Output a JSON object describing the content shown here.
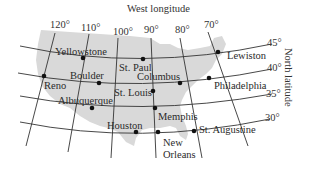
{
  "map": {
    "title": "West longitude",
    "side_label": "North latitude",
    "land_color": "#d9d9d9",
    "line_color": "#333333",
    "dot_color": "#111111",
    "longitudes": [
      {
        "label": "120°",
        "value": 120
      },
      {
        "label": "110°",
        "value": 110
      },
      {
        "label": "100°",
        "value": 100
      },
      {
        "label": "90°",
        "value": 90
      },
      {
        "label": "80°",
        "value": 80
      },
      {
        "label": "70°",
        "value": 70
      }
    ],
    "latitudes": [
      {
        "label": "45°",
        "value": 45
      },
      {
        "label": "40°",
        "value": 40
      },
      {
        "label": "35°",
        "value": 35
      },
      {
        "label": "30°",
        "value": 30
      }
    ],
    "cities": [
      {
        "name": "Yellowstone"
      },
      {
        "name": "St. Paul"
      },
      {
        "name": "Lewiston"
      },
      {
        "name": "Reno"
      },
      {
        "name": "Boulder"
      },
      {
        "name": "Columbus"
      },
      {
        "name": "Philadelphia"
      },
      {
        "name": "St. Louis"
      },
      {
        "name": "Albuquerque"
      },
      {
        "name": "Memphis"
      },
      {
        "name": "Houston"
      },
      {
        "name": "New"
      },
      {
        "name": "Orleans"
      },
      {
        "name": "St. Augustine"
      }
    ]
  }
}
